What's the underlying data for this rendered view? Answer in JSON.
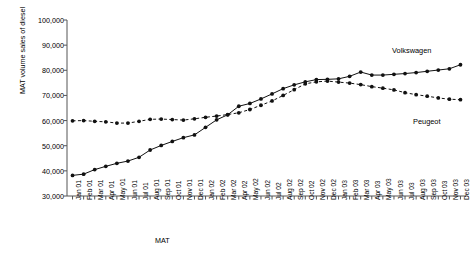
{
  "chart_data": {
    "type": "line",
    "title": "",
    "xlabel": "MAT",
    "ylabel": "MAT volume sales of diesel",
    "ylim": [
      30000,
      100000
    ],
    "yticks": [
      "30,000",
      "40,000",
      "50,000",
      "60,000",
      "70,000",
      "80,000",
      "90,000",
      "100,000"
    ],
    "ytick_values": [
      30000,
      40000,
      50000,
      60000,
      70000,
      80000,
      90000,
      100000
    ],
    "grid": false,
    "legend_position": "inline-right",
    "categories": [
      "Jan 01",
      "Feb 01",
      "Mar 01",
      "Apr 01",
      "May 01",
      "Jun 01",
      "Jul 01",
      "Aug 01",
      "Sep 01",
      "Oct 01",
      "Nov 01",
      "Dec 01",
      "Jan 02",
      "Feb 02",
      "Mar 02",
      "Apr 02",
      "May 02",
      "Jun 02",
      "Jul 02",
      "Aug 02",
      "Sep 02",
      "Oct 02",
      "Nov 02",
      "Dec 02",
      "Jan 03",
      "Feb 03",
      "Mar 03",
      "Apr 03",
      "May 03",
      "Jun 03",
      "Jul 03",
      "Aug 03",
      "Sep 03",
      "Oct 03",
      "Nov 03",
      "Dec 03"
    ],
    "series": [
      {
        "name": "Volkswagen",
        "style": "solid",
        "marker": "circle",
        "values": [
          38200,
          38700,
          40500,
          41800,
          43000,
          43900,
          45400,
          48300,
          50100,
          51700,
          53200,
          54300,
          57300,
          60300,
          62300,
          65700,
          66800,
          68600,
          70600,
          72700,
          74200,
          75400,
          76300,
          76400,
          76600,
          77600,
          79300,
          78100,
          78100,
          78400,
          78700,
          79100,
          79600,
          80100,
          80600,
          82200
        ]
      },
      {
        "name": "Peugeot",
        "style": "dashed",
        "marker": "circle",
        "values": [
          59900,
          60000,
          59700,
          59500,
          59000,
          59000,
          59700,
          60500,
          60600,
          60400,
          60200,
          60700,
          61300,
          61800,
          62400,
          63100,
          64400,
          66100,
          67800,
          70000,
          72300,
          74600,
          75400,
          75700,
          75300,
          74900,
          74300,
          73500,
          72900,
          72200,
          71100,
          70300,
          69700,
          69000,
          68500,
          68300
        ]
      }
    ]
  },
  "labels": {
    "volkswagen": "Volkswagen",
    "peugeot": "Peugeot"
  },
  "caption": {
    "text": ""
  }
}
